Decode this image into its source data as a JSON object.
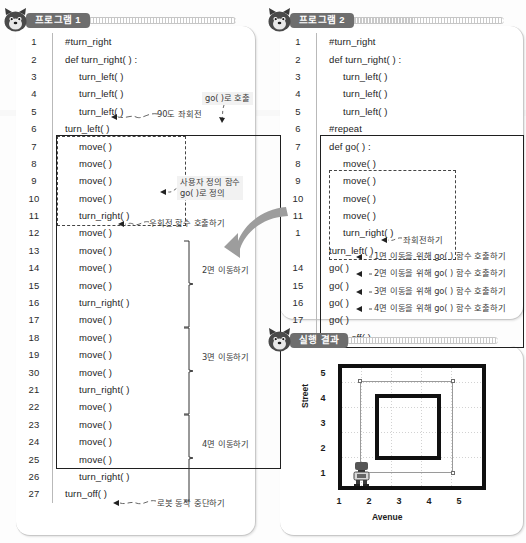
{
  "panels": {
    "program1": {
      "tag": "프로그램 1",
      "mascot_icon": "wolf-mascot-icon",
      "lines": [
        {
          "n": "1",
          "text": "#turn_right",
          "indent": 0
        },
        {
          "n": "2",
          "text": "def turn_right( ) :",
          "indent": 0
        },
        {
          "n": "3",
          "text": "turn_left( )",
          "indent": 1
        },
        {
          "n": "4",
          "text": "turn_left( )",
          "indent": 1
        },
        {
          "n": "5",
          "text": "turn_left( )",
          "indent": 1
        },
        {
          "n": "6",
          "text": "turn_left( )",
          "indent": 0
        },
        {
          "n": "7",
          "text": "move( )",
          "indent": 1
        },
        {
          "n": "8",
          "text": "move( )",
          "indent": 1
        },
        {
          "n": "9",
          "text": "move( )",
          "indent": 1
        },
        {
          "n": "10",
          "text": "move( )",
          "indent": 1
        },
        {
          "n": "11",
          "text": "turn_right( )",
          "indent": 1
        },
        {
          "n": "12",
          "text": "move( )",
          "indent": 1
        },
        {
          "n": "13",
          "text": "move( )",
          "indent": 1
        },
        {
          "n": "14",
          "text": "move( )",
          "indent": 1
        },
        {
          "n": "15",
          "text": "move( )",
          "indent": 1
        },
        {
          "n": "16",
          "text": "turn_right( )",
          "indent": 1
        },
        {
          "n": "17",
          "text": "move( )",
          "indent": 1
        },
        {
          "n": "18",
          "text": "move( )",
          "indent": 1
        },
        {
          "n": "19",
          "text": "move( )",
          "indent": 1
        },
        {
          "n": "30",
          "text": "move( )",
          "indent": 1
        },
        {
          "n": "21",
          "text": "turn_right( )",
          "indent": 1
        },
        {
          "n": "22",
          "text": "move( )",
          "indent": 1
        },
        {
          "n": "23",
          "text": "move( )",
          "indent": 1
        },
        {
          "n": "24",
          "text": "move( )",
          "indent": 1
        },
        {
          "n": "25",
          "text": "move( )",
          "indent": 1
        },
        {
          "n": "26",
          "text": "turn_right( )",
          "indent": 1
        },
        {
          "n": "27",
          "text": "turn_off( )",
          "indent": 0
        }
      ],
      "notes": {
        "rotate90": "90도 좌회전",
        "call_go": "go( )로 호출",
        "define_go": "사용자 정의 함수\ngo( )로 정의",
        "call_turn_right": "우회전 함수 호출하기",
        "move2": "2면 이동하기",
        "move3": "3면 이동하기",
        "move4": "4면 이동하기",
        "turn_off": "로봇 동작 중단하기"
      }
    },
    "program2": {
      "tag": "프로그램 2",
      "mascot_icon": "wolf-mascot-icon",
      "lines": [
        {
          "n": "1",
          "text": "#turn_right",
          "indent": 0
        },
        {
          "n": "2",
          "text": "def turn_right( ) :",
          "indent": 0
        },
        {
          "n": "3",
          "text": "turn_left( )",
          "indent": 1
        },
        {
          "n": "4",
          "text": "turn_left( )",
          "indent": 1
        },
        {
          "n": "5",
          "text": "turn_left( )",
          "indent": 1
        },
        {
          "n": "6",
          "text": "#repeat",
          "indent": 0
        },
        {
          "n": "7",
          "text": "def go( ) :",
          "indent": 0
        },
        {
          "n": "8",
          "text": "move( )",
          "indent": 1
        },
        {
          "n": "9",
          "text": "move( )",
          "indent": 1
        },
        {
          "n": "10",
          "text": "move( )",
          "indent": 1
        },
        {
          "n": "11",
          "text": "move( )",
          "indent": 1
        },
        {
          "n": "1",
          "text": "turn_right( )",
          "indent": 1
        },
        {
          "n": "",
          "text": "turn_left( )",
          "indent": 0
        },
        {
          "n": "14",
          "text": "go( )",
          "indent": 0
        },
        {
          "n": "15",
          "text": "go( )",
          "indent": 0
        },
        {
          "n": "16",
          "text": "go( )",
          "indent": 0
        },
        {
          "n": "17",
          "text": "go( )",
          "indent": 0
        },
        {
          "n": "18",
          "text": "turn_off( )",
          "indent": 0
        }
      ],
      "notes": {
        "turn_left": "좌회전하기",
        "go1": "1면 이동을 위해 go( ) 함수 호출하기",
        "go2": "2면 이동을 위해 go( ) 함수 호출하기",
        "go3": "3면 이동을 위해 go( ) 함수 호출하기",
        "go4": "4면 이동을 위해 go( ) 함수 호출하기"
      }
    },
    "result": {
      "tag": "실행 결과",
      "mascot_icon": "wolf-mascot-icon"
    }
  },
  "chart_data": {
    "type": "scatter",
    "title": "실행 결과",
    "xlabel": "Avenue",
    "ylabel": "Street",
    "x_ticks": [
      "1",
      "2",
      "3",
      "4",
      "5"
    ],
    "y_ticks": [
      "1",
      "2",
      "3",
      "4",
      "5"
    ],
    "xlim": [
      1,
      5
    ],
    "ylim": [
      1,
      5
    ],
    "grid": true,
    "legend": "none",
    "robot": {
      "avenue": 1,
      "street": 1,
      "icon": "robot-icon"
    },
    "shapes": [
      {
        "name": "outer-wall",
        "type": "rect",
        "x0": 0.6,
        "y0": 0.6,
        "x1": 5.5,
        "y1": 5.5,
        "stroke": "#101010",
        "width": 4
      },
      {
        "name": "robot-path",
        "type": "rect",
        "x0": 1.0,
        "y0": 1.0,
        "x1": 5.0,
        "y1": 5.0,
        "stroke": "#9a9a9a",
        "width": 1
      },
      {
        "name": "inner-square",
        "type": "rect",
        "x0": 1.5,
        "y0": 1.5,
        "x1": 4.5,
        "y1": 4.5,
        "stroke": "#101010",
        "width": 4
      }
    ]
  }
}
